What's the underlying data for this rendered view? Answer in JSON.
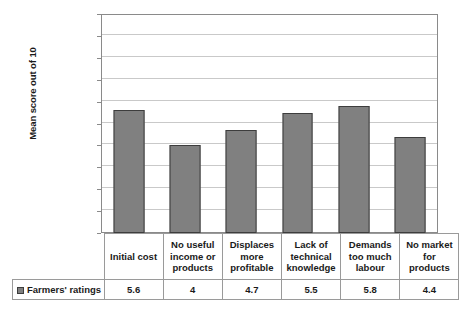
{
  "chart_data": {
    "type": "bar",
    "title": "",
    "xlabel": "",
    "ylabel": "Mean score out of 10",
    "ylim": [
      0,
      10
    ],
    "ytick_step": 1,
    "yticks": [
      "10",
      "9",
      "8",
      "7",
      "6",
      "5",
      "4",
      "3",
      "2",
      "1",
      "0"
    ],
    "grid": true,
    "legend_position": "data-table-left",
    "categories": [
      "Initial cost",
      "No useful income or products",
      "Displaces more profitable",
      "Lack of technical knowledge",
      "Demands too much labour",
      "No market for products"
    ],
    "category_lines": [
      [
        "Initial cost"
      ],
      [
        "No useful",
        "income or",
        "products"
      ],
      [
        "Displaces",
        "more",
        "profitable"
      ],
      [
        "Lack of",
        "technical",
        "knowledge"
      ],
      [
        "Demands",
        "too much",
        "labour"
      ],
      [
        "No market",
        "for",
        "products"
      ]
    ],
    "series": [
      {
        "name": "Farmers' ratings",
        "values": [
          5.6,
          4,
          4.7,
          5.5,
          5.8,
          4.4
        ],
        "value_labels": [
          "5.6",
          "4",
          "4.7",
          "5.5",
          "5.8",
          "4.4"
        ],
        "color": "#808080",
        "border_color": "#3d3d3d"
      }
    ]
  },
  "legend": {
    "series_label": "Farmers' ratings",
    "swatch_icon": "square-swatch-icon"
  },
  "axis": {
    "y_title": "Mean score out of 10"
  },
  "colors": {
    "bar_fill": "#808080",
    "bar_border": "#3d3d3d",
    "gridline": "#c9c9c9",
    "plot_border": "#8a8a8a",
    "table_border": "#9a9a9a",
    "text": "#1a1a1a",
    "background": "#ffffff"
  }
}
